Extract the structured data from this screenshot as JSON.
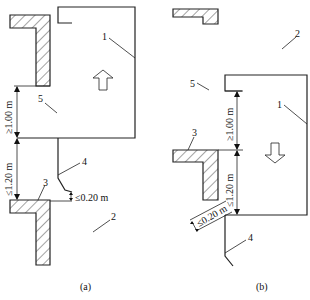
{
  "figure": {
    "panel_a": {
      "caption": "(a)",
      "direction_arrow": "up",
      "labels": {
        "car": "1",
        "landing_area": "2",
        "landing_sill": "3",
        "car_apron": "4",
        "gap_zone": "5"
      },
      "dimensions": {
        "upper": "≥1.00 m",
        "lower": "≤1.20 m",
        "apron_gap": "≤0.20 m"
      }
    },
    "panel_b": {
      "caption": "(b)",
      "direction_arrow": "down",
      "labels": {
        "car": "1",
        "landing_area": "2",
        "landing_sill": "3",
        "car_apron": "4",
        "gap_zone": "5"
      },
      "dimensions": {
        "upper": "≥1.00 m",
        "lower": "≤1.20 m",
        "apron_gap": "≤0.20 m"
      }
    },
    "colors": {
      "line": "#222222",
      "background": "#ffffff"
    }
  }
}
